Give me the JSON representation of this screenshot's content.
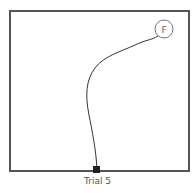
{
  "figure": {
    "caption": "Trial 5",
    "goal_label": "F",
    "colors": {
      "border": "#555555",
      "path": "#333333",
      "start_marker": "#222222",
      "goal_circle": "#777777"
    }
  }
}
